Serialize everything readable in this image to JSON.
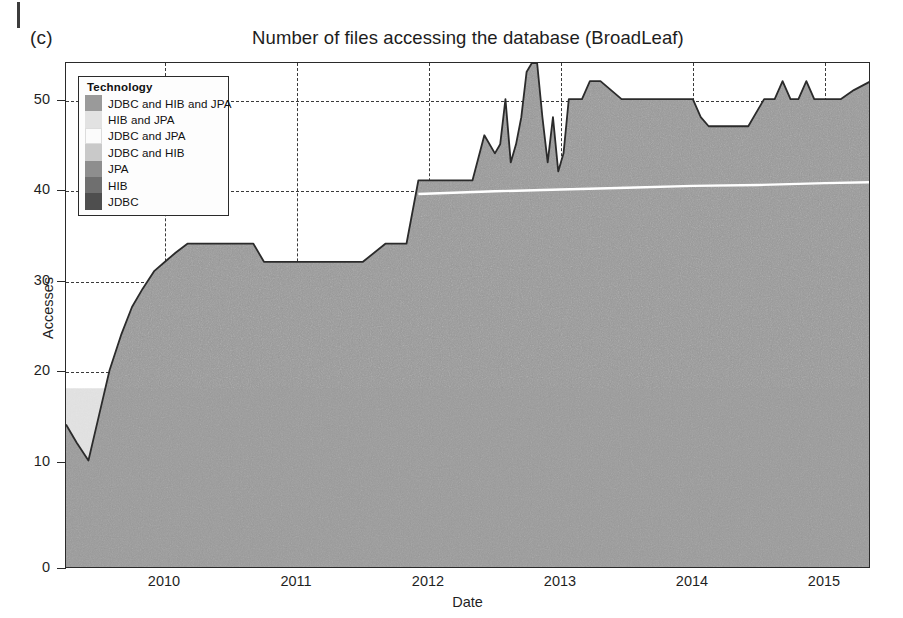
{
  "figure": {
    "panel_label": "(c)",
    "title": "Number of files accessing the database (BroadLeaf)"
  },
  "legend": {
    "title": "Technology",
    "items": [
      {
        "label": "JDBC and HIB and JPA",
        "color": "#9a9a9a"
      },
      {
        "label": "HIB and JPA",
        "color": "#e2e2e2"
      },
      {
        "label": "JDBC and JPA",
        "color": "#fbfbfb"
      },
      {
        "label": "JDBC and HIB",
        "color": "#c9c9c9"
      },
      {
        "label": "JPA",
        "color": "#8e8e8e"
      },
      {
        "label": "HIB",
        "color": "#6f6f6f"
      },
      {
        "label": "JDBC",
        "color": "#4e4e4e"
      }
    ]
  },
  "chart_data": {
    "type": "area",
    "title": "Number of files accessing the database (BroadLeaf)",
    "xlabel": "Date",
    "ylabel": "Accesses",
    "xlim": [
      2009.25,
      2015.35
    ],
    "ylim": [
      0,
      56
    ],
    "grid": true,
    "legend_position": "top-left-inside",
    "yticks": [
      0,
      10,
      20,
      30,
      40,
      50
    ],
    "xticks": [
      2010,
      2011,
      2012,
      2013,
      2014,
      2015
    ],
    "xtick_labels": [
      "2010",
      "2011",
      "2012",
      "2013",
      "2014",
      "2015"
    ],
    "stacked": true,
    "series": [
      {
        "name": "Total (stacked top boundary)",
        "color": "#9a9a9a",
        "x": [
          2009.25,
          2009.33,
          2009.42,
          2009.5,
          2009.58,
          2009.67,
          2009.75,
          2009.83,
          2009.92,
          2010.0,
          2010.08,
          2010.17,
          2010.33,
          2010.5,
          2010.67,
          2010.75,
          2010.83,
          2011.0,
          2011.25,
          2011.5,
          2011.67,
          2011.75,
          2011.83,
          2011.92,
          2012.0,
          2012.17,
          2012.33,
          2012.42,
          2012.5,
          2012.54,
          2012.58,
          2012.62,
          2012.66,
          2012.7,
          2012.74,
          2012.78,
          2012.82,
          2012.86,
          2012.9,
          2012.94,
          2012.98,
          2013.02,
          2013.06,
          2013.1,
          2013.16,
          2013.22,
          2013.3,
          2013.38,
          2013.46,
          2013.54,
          2013.62,
          2013.7,
          2013.8,
          2013.9,
          2014.0,
          2014.06,
          2014.12,
          2014.2,
          2014.3,
          2014.42,
          2014.54,
          2014.62,
          2014.68,
          2014.74,
          2014.8,
          2014.86,
          2014.92,
          2015.0,
          2015.12,
          2015.22,
          2015.35
        ],
        "y": [
          16,
          14,
          12,
          17,
          22,
          26,
          29,
          31,
          33,
          34,
          35,
          36,
          36,
          36,
          36,
          34,
          34,
          34,
          34,
          34,
          36,
          36,
          36,
          43,
          43,
          43,
          43,
          48,
          46,
          47,
          52,
          45,
          47,
          50,
          55,
          56,
          56,
          50,
          45,
          50,
          44,
          46,
          52,
          52,
          52,
          54,
          54,
          53,
          52,
          52,
          52,
          52,
          52,
          52,
          52,
          50,
          49,
          49,
          49,
          49,
          52,
          52,
          54,
          52,
          52,
          54,
          52,
          52,
          52,
          53,
          54
        ],
        "note": "Upper outline of the stacked area (sum of all technologies)"
      },
      {
        "name": "Lower bands boundary (white separator line)",
        "color": "#ffffff",
        "x": [
          2011.92,
          2012.5,
          2013.0,
          2013.5,
          2014.0,
          2014.5,
          2015.0,
          2015.35
        ],
        "y": [
          41.5,
          41.8,
          42.0,
          42.2,
          42.4,
          42.5,
          42.7,
          42.8
        ],
        "note": "Thin white band separating the two topmost stacked technologies"
      }
    ]
  },
  "axes": {
    "y_title": "Accesses",
    "x_title": "Date",
    "y_labels": [
      "50",
      "40",
      "30",
      "20",
      "10",
      "0"
    ],
    "x_labels": [
      "2010",
      "2011",
      "2012",
      "2013",
      "2014",
      "2015"
    ]
  }
}
